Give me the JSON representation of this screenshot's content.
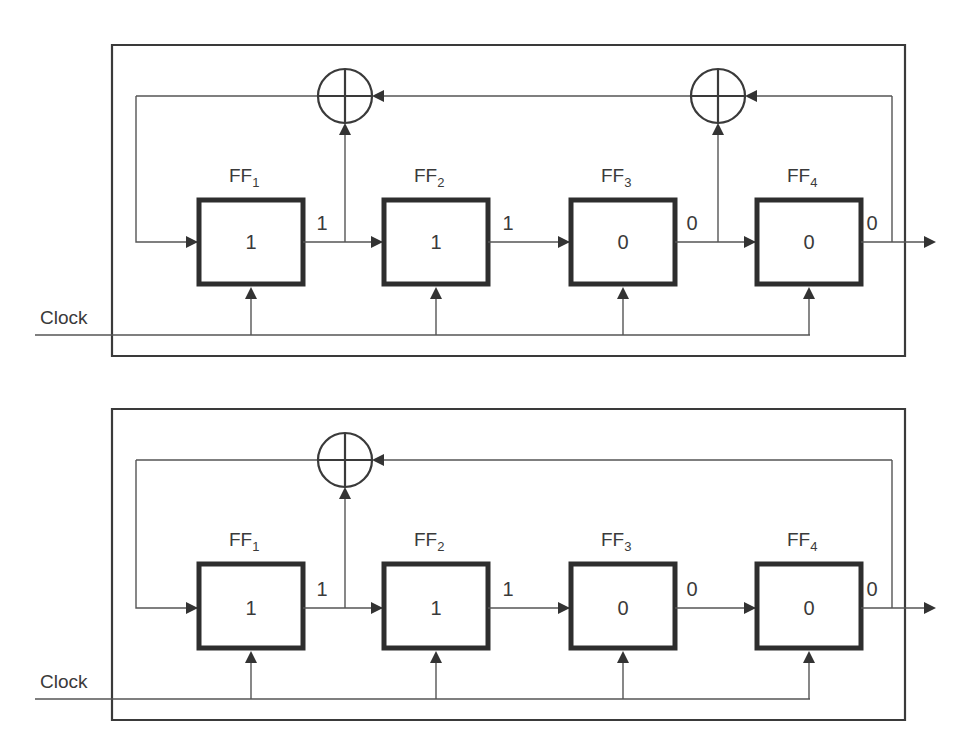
{
  "diagrams": [
    {
      "name": "lfsr-top",
      "clock_label": "Clock",
      "flip_flops": [
        {
          "name": "FF",
          "sub": "1",
          "state": "1",
          "output": "1"
        },
        {
          "name": "FF",
          "sub": "2",
          "state": "1",
          "output": "1"
        },
        {
          "name": "FF",
          "sub": "3",
          "state": "0",
          "output": "0"
        },
        {
          "name": "FF",
          "sub": "4",
          "state": "0",
          "output": "0"
        }
      ],
      "xor_taps": [
        1,
        3
      ]
    },
    {
      "name": "lfsr-bottom",
      "clock_label": "Clock",
      "flip_flops": [
        {
          "name": "FF",
          "sub": "1",
          "state": "1",
          "output": "1"
        },
        {
          "name": "FF",
          "sub": "2",
          "state": "1",
          "output": "1"
        },
        {
          "name": "FF",
          "sub": "3",
          "state": "0",
          "output": "0"
        },
        {
          "name": "FF",
          "sub": "4",
          "state": "0",
          "output": "0"
        }
      ],
      "xor_taps": [
        1
      ]
    }
  ]
}
